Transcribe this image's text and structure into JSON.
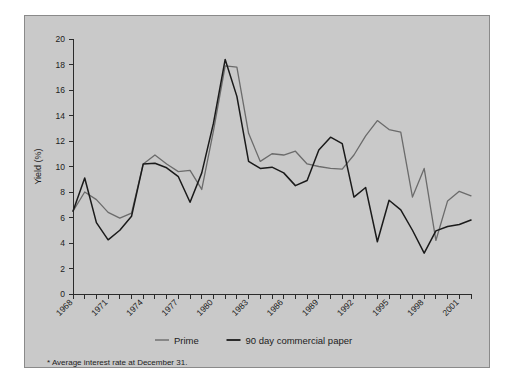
{
  "figure": {
    "background_color": "#c9c9c9",
    "page_color": "#ffffff",
    "border_color": "#8a8a8a"
  },
  "axis": {
    "ylabel": "Yield (%)",
    "ylim": [
      0,
      20
    ],
    "ytick_step": 2,
    "yticks": [
      "0",
      "2",
      "4",
      "6",
      "8",
      "10",
      "12",
      "14",
      "16",
      "18",
      "20"
    ],
    "xlim": [
      1968,
      2002
    ],
    "xtick_labels": [
      "1968",
      "1971",
      "1974",
      "1977",
      "1980",
      "1983",
      "1986",
      "1989",
      "1992",
      "1995",
      "1998",
      "2001"
    ],
    "xtick_label_years": [
      1968,
      1971,
      1974,
      1977,
      1980,
      1983,
      1986,
      1989,
      1992,
      1995,
      1998,
      2001
    ]
  },
  "legend": {
    "position": "bottom-center",
    "items": [
      {
        "label": "Prime",
        "color": "#6b6b6b"
      },
      {
        "label": "90 day commercial paper",
        "color": "#1a1a1a"
      }
    ]
  },
  "footnote": {
    "text": "* Average interest rate at December 31."
  },
  "chart_data": {
    "type": "line",
    "title": "",
    "subtitle": "",
    "xlabel": "",
    "ylabel": "Yield (%)",
    "xlim": [
      1968,
      2002
    ],
    "ylim": [
      0,
      20
    ],
    "grid": false,
    "legend_position": "bottom-center",
    "annotations": [
      "* Average interest rate at December 31."
    ],
    "x": [
      1968,
      1969,
      1970,
      1971,
      1972,
      1973,
      1974,
      1975,
      1976,
      1977,
      1978,
      1979,
      1980,
      1981,
      1982,
      1983,
      1984,
      1985,
      1986,
      1987,
      1988,
      1989,
      1990,
      1991,
      1992,
      1993,
      1994,
      1995,
      1996,
      1997,
      1998,
      1999,
      2000,
      2001,
      2002
    ],
    "series": [
      {
        "name": "Prime",
        "color": "#6b6b6b",
        "values": [
          6.5,
          8.0,
          7.4,
          6.4,
          5.95,
          6.35,
          10.2,
          10.9,
          10.2,
          9.6,
          9.7,
          8.2,
          12.8,
          17.9,
          17.8,
          12.6,
          10.4,
          11.0,
          10.9,
          11.2,
          10.2,
          10.0,
          9.85,
          9.8,
          10.9,
          12.4,
          13.6,
          12.9,
          12.7,
          7.6,
          9.85,
          4.2,
          7.3,
          8.05,
          7.7
        ]
      },
      {
        "name": "90 day commercial paper",
        "color": "#1a1a1a",
        "values": [
          6.5,
          9.1,
          5.6,
          4.25,
          5.0,
          6.1,
          10.2,
          10.25,
          9.9,
          9.2,
          7.2,
          9.5,
          13.4,
          18.4,
          15.5,
          10.4,
          9.85,
          9.95,
          9.5,
          8.5,
          8.9,
          11.3,
          12.3,
          11.8,
          7.6,
          8.35,
          4.1,
          7.35,
          6.6,
          5.0,
          3.2,
          4.95,
          5.3,
          5.45,
          5.8
        ]
      }
    ],
    "series_plotted": {
      "note": "values arrays above are ordered year-by-year matching x",
      "prime_year_values": [
        [
          1968,
          6.5
        ],
        [
          1969,
          8.0
        ],
        [
          1970,
          7.4
        ],
        [
          1971,
          6.4
        ],
        [
          1972,
          5.95
        ],
        [
          1973,
          6.35
        ],
        [
          1974,
          10.2
        ],
        [
          1975,
          10.9
        ],
        [
          1976,
          10.2
        ],
        [
          1977,
          9.6
        ],
        [
          1978,
          9.7
        ],
        [
          1979,
          8.2
        ],
        [
          1980,
          12.8
        ],
        [
          1981,
          17.9
        ],
        [
          1982,
          17.8
        ],
        [
          1983,
          12.6
        ],
        [
          1984,
          10.4
        ],
        [
          1985,
          11.0
        ],
        [
          1986,
          10.9
        ],
        [
          1987,
          11.2
        ],
        [
          1988,
          10.2
        ],
        [
          1989,
          10.0
        ],
        [
          1990,
          9.85
        ],
        [
          1991,
          9.8
        ],
        [
          1992,
          10.9
        ],
        [
          1993,
          12.4
        ],
        [
          1994,
          13.6
        ],
        [
          1995,
          12.9
        ],
        [
          1996,
          12.7
        ],
        [
          1997,
          7.6
        ],
        [
          1998,
          9.85
        ],
        [
          1999,
          7.3
        ],
        [
          2000,
          8.05
        ],
        [
          2001,
          7.7
        ],
        [
          2002,
          4.2
        ]
      ],
      "commercial_paper_year_values": [
        [
          1968,
          6.5
        ],
        [
          1969,
          9.1
        ],
        [
          1970,
          5.6
        ],
        [
          1971,
          4.25
        ],
        [
          1972,
          5.0
        ],
        [
          1973,
          6.1
        ],
        [
          1974,
          10.2
        ],
        [
          1975,
          10.25
        ],
        [
          1976,
          9.9
        ],
        [
          1977,
          9.2
        ],
        [
          1978,
          7.2
        ],
        [
          1979,
          9.5
        ],
        [
          1980,
          13.4
        ],
        [
          1981,
          18.4
        ],
        [
          1982,
          15.5
        ],
        [
          1983,
          10.4
        ],
        [
          1984,
          9.85
        ],
        [
          1985,
          9.95
        ],
        [
          1986,
          9.5
        ],
        [
          1987,
          8.5
        ],
        [
          1988,
          8.9
        ],
        [
          1989,
          11.3
        ],
        [
          1990,
          12.3
        ],
        [
          1991,
          11.8
        ],
        [
          1992,
          7.6
        ],
        [
          1993,
          8.35
        ],
        [
          1994,
          4.1
        ],
        [
          1995,
          7.35
        ],
        [
          1996,
          6.6
        ],
        [
          1997,
          5.0
        ],
        [
          1998,
          3.2
        ],
        [
          1999,
          4.95
        ],
        [
          2000,
          5.3
        ],
        [
          2001,
          5.45
        ],
        [
          2002,
          5.8
        ]
      ]
    }
  }
}
